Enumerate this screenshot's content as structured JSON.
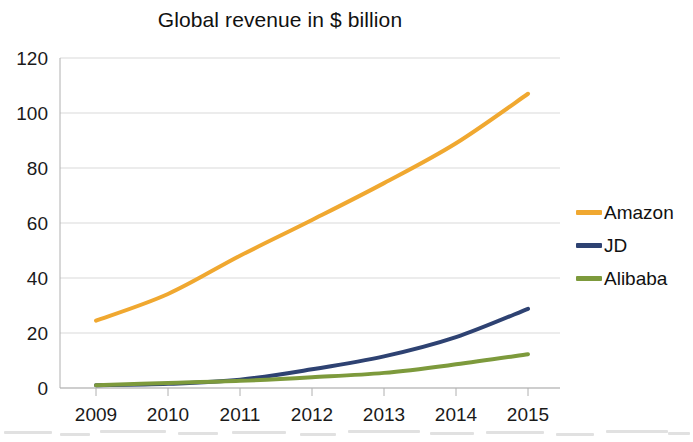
{
  "chart_data": {
    "type": "line",
    "title": "Global revenue in $ billion",
    "xlabel": "",
    "ylabel": "",
    "categories": [
      "2009",
      "2010",
      "2011",
      "2012",
      "2013",
      "2014",
      "2015"
    ],
    "x": [
      2009,
      2010,
      2011,
      2012,
      2013,
      2014,
      2015
    ],
    "ylim": [
      0,
      120
    ],
    "ytick_values": [
      0,
      20,
      40,
      60,
      80,
      100,
      120
    ],
    "ytick_labels": [
      "0",
      "20",
      "40",
      "60",
      "80",
      "100",
      "120"
    ],
    "xtick_labels": [
      "2009",
      "2010",
      "2011",
      "2012",
      "2013",
      "2014",
      "2015"
    ],
    "grid": true,
    "grid_axis": "y",
    "legend_position": "right",
    "series": [
      {
        "name": "Amazon",
        "color": "#F0A830",
        "values": [
          24.5,
          34.2,
          48.1,
          61.1,
          74.5,
          89.0,
          107.0
        ]
      },
      {
        "name": "JD",
        "color": "#2E4272",
        "values": [
          1.0,
          1.5,
          3.0,
          6.8,
          11.5,
          18.5,
          28.8
        ]
      },
      {
        "name": "Alibaba",
        "color": "#7D9A3C",
        "values": [
          1.0,
          1.8,
          2.6,
          3.9,
          5.5,
          8.6,
          12.3
        ]
      }
    ]
  },
  "legend": {
    "items": [
      {
        "label": "Amazon",
        "color": "#F0A830"
      },
      {
        "label": "JD",
        "color": "#2E4272"
      },
      {
        "label": "Alibaba",
        "color": "#7D9A3C"
      }
    ]
  },
  "axes": {
    "grid_color": "#d9d9d9",
    "axis_color": "#b0b0b0"
  }
}
